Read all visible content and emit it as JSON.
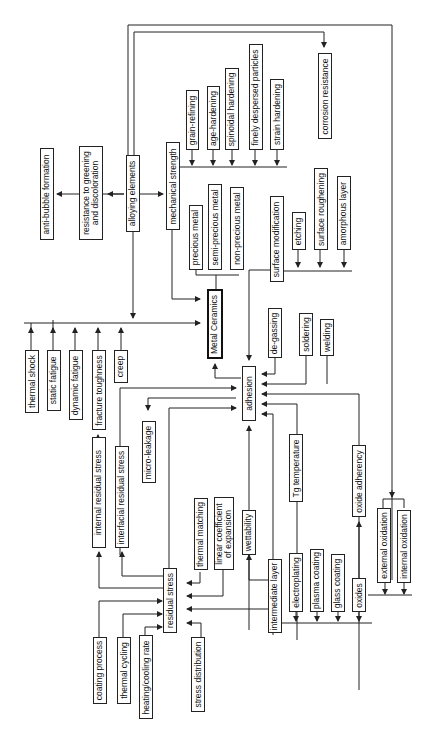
{
  "diagram": {
    "center": "Metal Ceramics",
    "nodes": {
      "anti_bubble": "anti-bubble formation",
      "greening": "resistance to greening\nand discoloration",
      "alloying": "alloying elements",
      "mech_strength": "mechanical strength",
      "grain_refining": "grain-refining",
      "age_hardening": "age-hardening",
      "spinodal": "spinoidal hardening",
      "dispersed": "finely despersed particles",
      "strain": "strain hardening",
      "corrosion": "corrosion resistance",
      "precious": "precious metal",
      "semi_precious": "semi-precious metal",
      "non_precious": "non-precious metal",
      "surface_mod": "surface modification",
      "etching": "etching",
      "roughening": "surface roughening",
      "amorphous": "amorphous layer",
      "metal_ceramics": "Metal Ceramics",
      "thermal_shock": "thermal shock",
      "static_fatigue": "static fatigue",
      "dynamic_fatigue": "dynamic fatigue",
      "fracture": "fracture toughness",
      "creep": "creep",
      "degassing": "de-gassing",
      "soldering": "soldering",
      "welding": "welding",
      "adhesion": "adhesion",
      "internal_rs": "internal residual stress",
      "interfacial_rs": "interfacial residual stress",
      "micro_leakage": "micro-leakage",
      "tg": "Tg temperature",
      "oxide_adherency": "oxide adherency",
      "residual_stress": "residual stress",
      "thermal_matching": "thermal matching",
      "linear_coef": "linear coefficient\nof expansion",
      "wettability": "wettability",
      "coating_process": "coating process",
      "thermal_cycling": "thermal cycling",
      "heating_rate": "heating/cooling rate",
      "stress_dist": "stress distribution",
      "intermediate": "intermediate layer",
      "electroplating": "electroplating",
      "plasma": "plasma coating",
      "glass": "glass coating",
      "oxides": "oxides",
      "external_ox": "external oxidation",
      "internal_ox": "internal oxidation"
    },
    "line_color": "#222222"
  }
}
